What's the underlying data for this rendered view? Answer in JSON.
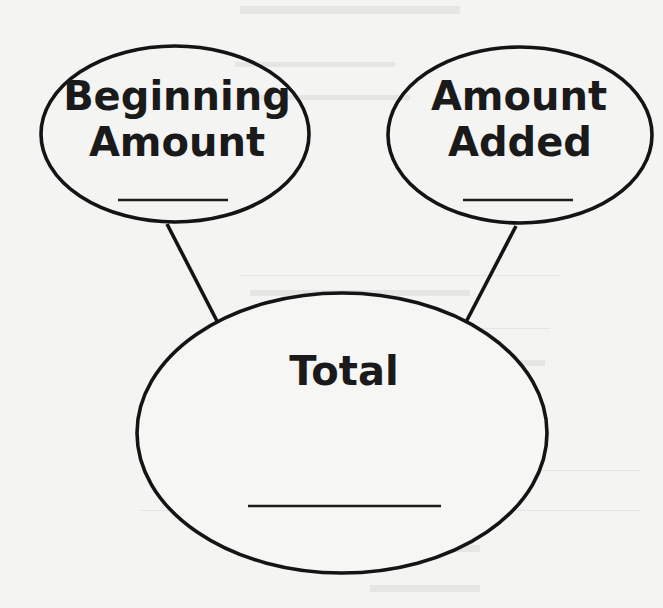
{
  "diagram": {
    "type": "number-bond",
    "nodes": [
      {
        "id": "beginning",
        "lines": [
          "Beginning",
          "Amount"
        ],
        "answer_blank": "",
        "shape": "ellipse"
      },
      {
        "id": "added",
        "lines": [
          "Amount",
          "Added"
        ],
        "answer_blank": "",
        "shape": "ellipse"
      },
      {
        "id": "total",
        "lines": [
          "Total"
        ],
        "answer_blank": "",
        "shape": "ellipse"
      }
    ],
    "edges": [
      {
        "from": "beginning",
        "to": "total"
      },
      {
        "from": "added",
        "to": "total"
      }
    ],
    "colors": {
      "ink": "#141414",
      "paper": "#f4f4f3"
    }
  }
}
